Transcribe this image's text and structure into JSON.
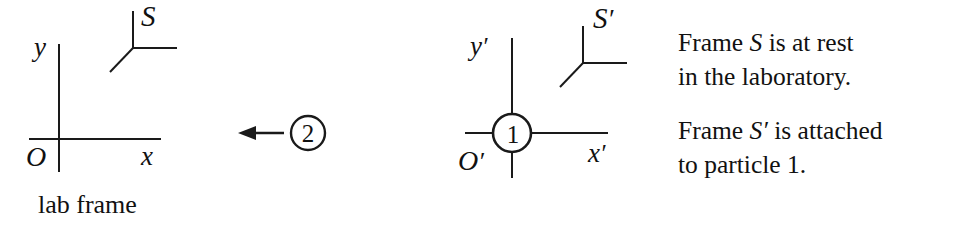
{
  "figure": {
    "type": "physics-reference-frame-diagram",
    "background_color": "#ffffff",
    "ink_color": "#111111"
  },
  "lab_frame": {
    "frame_symbol": "S",
    "axis_y_label": "y",
    "axis_x_label": "x",
    "origin_label": "O",
    "caption": "lab frame",
    "tripod_icon": "triad-axes-icon"
  },
  "primed_frame": {
    "frame_symbol": "S",
    "frame_symbol_prime": "′",
    "axis_y_label": "y",
    "axis_y_prime": "′",
    "axis_x_label": "x",
    "axis_x_prime": "′",
    "origin_label": "O",
    "origin_prime": "′",
    "tripod_icon": "triad-axes-icon"
  },
  "particles": {
    "moving": {
      "id": "2",
      "label": "2",
      "motion_direction": "left",
      "arrow_icon": "left-arrow-icon"
    },
    "at_origin": {
      "id": "1",
      "label": "1"
    }
  },
  "notes": {
    "line1": "Frame ",
    "line1_symbol": "S",
    "line1_rest": " is at rest",
    "line2": "in the laboratory.",
    "line3": "Frame ",
    "line3_symbol": "S′",
    "line3_rest": " is attached",
    "line4": "to particle 1."
  }
}
